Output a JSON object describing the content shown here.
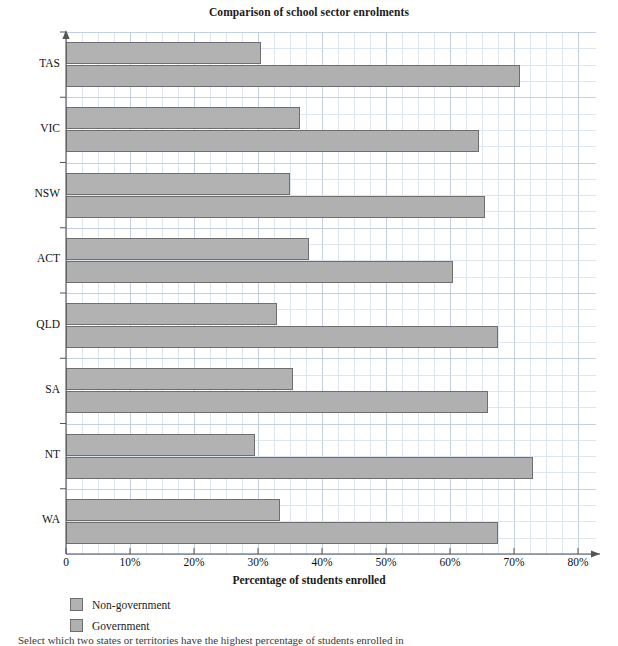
{
  "chart_data": {
    "type": "bar",
    "orientation": "horizontal",
    "title": "Comparison of school sector enrolments",
    "xlabel": "Percentage of students enrolled",
    "ylabel": "States",
    "categories": [
      "TAS",
      "VIC",
      "NSW",
      "ACT",
      "QLD",
      "SA",
      "NT",
      "WA"
    ],
    "series": [
      {
        "name": "Non-government",
        "color": "#b2b2b2",
        "values": [
          30.5,
          36.5,
          35.0,
          38.0,
          33.0,
          35.5,
          29.5,
          33.5
        ]
      },
      {
        "name": "Government",
        "color": "#b0b0b0",
        "values": [
          71.0,
          64.5,
          65.5,
          60.5,
          67.5,
          66.0,
          73.0,
          67.5
        ]
      }
    ],
    "xlim": [
      0,
      80
    ],
    "xticks": [
      0,
      10,
      20,
      30,
      40,
      50,
      60,
      70,
      80
    ],
    "xtick_labels": [
      "0",
      "10%",
      "20%",
      "30%",
      "40%",
      "50%",
      "60%",
      "70%",
      "80%"
    ],
    "grid": true,
    "grid_color": "#cfd8e8",
    "legend_position": "below-left"
  },
  "legend": {
    "entries": [
      {
        "label": "Non-government"
      },
      {
        "label": "Government"
      }
    ]
  },
  "footer": {
    "note": "Select which two states or territories have the highest percentage of students enrolled in"
  }
}
